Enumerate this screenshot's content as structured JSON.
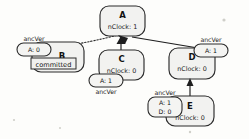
{
  "diagram": {
    "nodes": [
      {
        "id": "A",
        "label": "A",
        "detail": "nClock: 1"
      },
      {
        "id": "B",
        "label": "B",
        "detail": ""
      },
      {
        "id": "C",
        "label": "C",
        "detail": "nClock: 0"
      },
      {
        "id": "D",
        "label": "D",
        "detail": "nClock: 0"
      },
      {
        "id": "E",
        "label": "E",
        "detail": "nClock: 0"
      }
    ],
    "ancver_caption": "ancVer",
    "ancver_boxes": [
      {
        "owner": "B",
        "caption": "ancVer",
        "entries": [
          "A: 0"
        ]
      },
      {
        "owner": "C",
        "caption": "ancVer",
        "entries": [
          "A: 1"
        ]
      },
      {
        "owner": "D",
        "caption": "ancVer",
        "entries": [
          "A: 1"
        ]
      },
      {
        "owner": "E",
        "caption": "ancVer",
        "entries": [
          "A: 1",
          "D: 0"
        ]
      }
    ],
    "state_labels": [
      {
        "owner": "B",
        "text": "committed"
      }
    ],
    "edges": [
      {
        "from": "B",
        "to": "A",
        "style": "dotted",
        "arrow": true
      },
      {
        "from": "C",
        "to": "A",
        "style": "solid",
        "arrow": true
      },
      {
        "from": "D",
        "to": "A",
        "style": "solid",
        "arrow": true
      },
      {
        "from": "E",
        "to": "D",
        "style": "solid",
        "arrow": true
      }
    ]
  }
}
